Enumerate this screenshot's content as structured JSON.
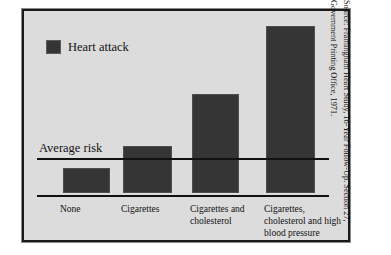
{
  "figure": {
    "legend_label": "Heart attack",
    "legend_swatch_color": "#353535",
    "average_risk_label": "Average risk",
    "background_color": "#dcdcdc",
    "frame_color": "#1a1a1a",
    "source_line_1": "Source: Framingham Heart Study, 16-Year Follow-Up. Section 27,",
    "source_line_2": "Government Printing Office, 1971."
  },
  "chart_data": {
    "type": "bar",
    "title": "",
    "xlabel": "",
    "ylabel": "",
    "categories": [
      "None",
      "Cigarettes",
      "Cigarettes and cholesterol",
      "Cigarettes, cholesterol and high blood pressure"
    ],
    "category_lines": [
      [
        "None"
      ],
      [
        "Cigarettes"
      ],
      [
        "Cigarettes and",
        "cholesterol"
      ],
      [
        "Cigarettes,",
        "cholesterol and high",
        "blood pressure"
      ]
    ],
    "series": [
      {
        "name": "Heart attack",
        "values": [
          0.58,
          1.12,
          2.33,
          3.94
        ]
      }
    ],
    "reference_line": {
      "label": "Average risk",
      "value": 1.0
    },
    "ylim": [
      0,
      4.2
    ],
    "grid": false,
    "legend_position": "top-left",
    "annotations": [
      "Average risk"
    ]
  }
}
